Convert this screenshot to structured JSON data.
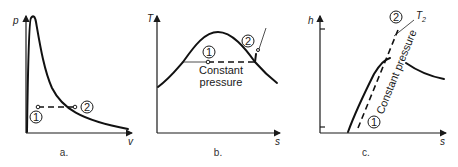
{
  "panels": [
    {
      "id": "a",
      "caption": "a.",
      "y_axis_label": "p",
      "x_axis_label": "v",
      "state_labels": [
        "1",
        "2"
      ]
    },
    {
      "id": "b",
      "caption": "b.",
      "y_axis_label": "T",
      "x_axis_label": "s",
      "state_labels": [
        "1",
        "2"
      ],
      "annotation_line1": "Constant",
      "annotation_line2": "pressure"
    },
    {
      "id": "c",
      "caption": "c.",
      "y_axis_label": "h",
      "x_axis_label": "s",
      "state_labels": [
        "1",
        "2"
      ],
      "annotation": "Constant pressure",
      "temperature_label": "T",
      "temperature_subscript": "2"
    }
  ]
}
